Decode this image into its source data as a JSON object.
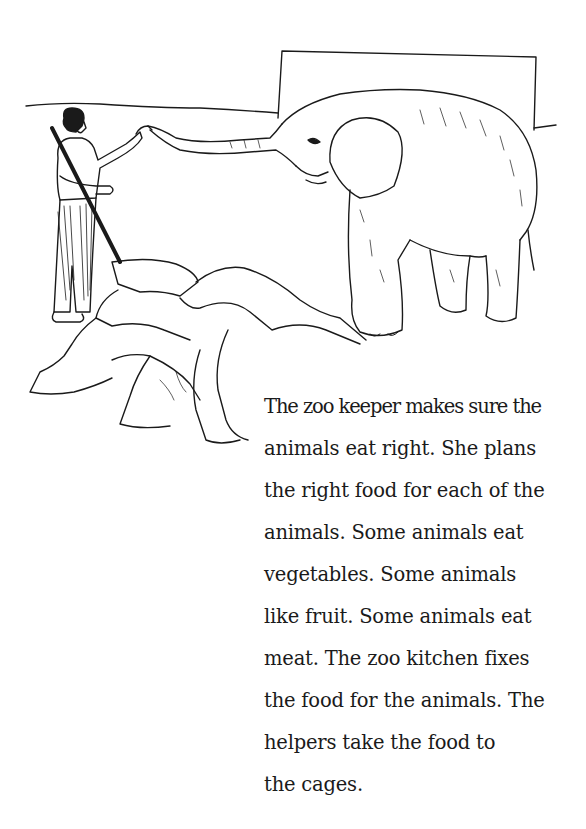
{
  "page": {
    "illustration": {
      "description": "Zoo keeper holding a long stick, touching the trunk of an elephant; rocks in the foreground and a wall/enclosure behind",
      "subjects": [
        "zoo-keeper",
        "elephant",
        "rocks",
        "enclosure-wall"
      ],
      "line_color": "#1a1a1a",
      "background": "#ffffff"
    },
    "text": {
      "lines": [
        "The zoo keeper makes sure the",
        "animals eat right. She plans",
        "the right food for each of the",
        "animals. Some animals eat",
        "vegetables. Some animals",
        "like fruit. Some animals eat",
        "meat. The zoo kitchen fixes",
        "the food for the animals. The",
        "helpers take the food to",
        "the cages."
      ]
    }
  }
}
